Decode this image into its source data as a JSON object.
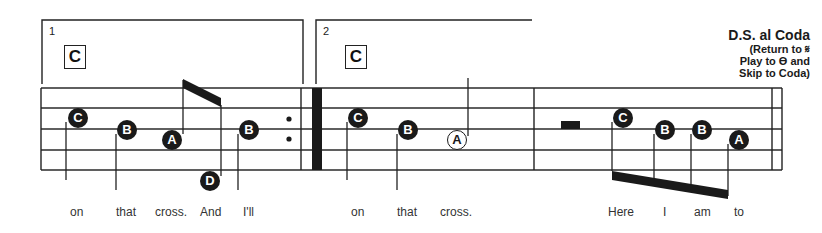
{
  "score": {
    "endings": [
      {
        "number": "1",
        "chord": "C"
      },
      {
        "number": "2",
        "chord": "C"
      }
    ],
    "navigation": {
      "title": "D.S. al Coda",
      "line1": "(Return to 𝄋",
      "line2": "Play to ϴ and",
      "line3": "Skip to Coda)"
    },
    "notes": [
      {
        "id": "m1-n1",
        "letter": "C",
        "x": 78,
        "y": 118,
        "filled": true
      },
      {
        "id": "m1-n2",
        "letter": "B",
        "x": 127,
        "y": 130,
        "filled": true
      },
      {
        "id": "m1-n3",
        "letter": "A",
        "x": 172,
        "y": 140,
        "filled": true
      },
      {
        "id": "m1-n4",
        "letter": "D",
        "x": 210,
        "y": 181,
        "filled": true
      },
      {
        "id": "m1-n5",
        "letter": "B",
        "x": 249,
        "y": 130,
        "filled": true
      },
      {
        "id": "m2-n1",
        "letter": "C",
        "x": 358,
        "y": 118,
        "filled": true
      },
      {
        "id": "m2-n2",
        "letter": "B",
        "x": 408,
        "y": 130,
        "filled": true
      },
      {
        "id": "m2-n3",
        "letter": "A",
        "x": 457,
        "y": 140,
        "filled": false
      },
      {
        "id": "m3-n1",
        "letter": "C",
        "x": 623,
        "y": 118,
        "filled": true
      },
      {
        "id": "m3-n2",
        "letter": "B",
        "x": 665,
        "y": 130,
        "filled": true
      },
      {
        "id": "m3-n3",
        "letter": "B",
        "x": 702,
        "y": 130,
        "filled": true
      },
      {
        "id": "m3-n4",
        "letter": "A",
        "x": 739,
        "y": 140,
        "filled": true
      }
    ],
    "lyrics": [
      {
        "text": "on",
        "x": 70
      },
      {
        "text": "that",
        "x": 116
      },
      {
        "text": "cross.",
        "x": 155
      },
      {
        "text": "And",
        "x": 200
      },
      {
        "text": "I'll",
        "x": 243
      },
      {
        "text": "on",
        "x": 351
      },
      {
        "text": "that",
        "x": 397
      },
      {
        "text": "cross.",
        "x": 440
      },
      {
        "text": "Here",
        "x": 608
      },
      {
        "text": "I",
        "x": 663
      },
      {
        "text": "am",
        "x": 694
      },
      {
        "text": "to",
        "x": 734
      }
    ]
  }
}
